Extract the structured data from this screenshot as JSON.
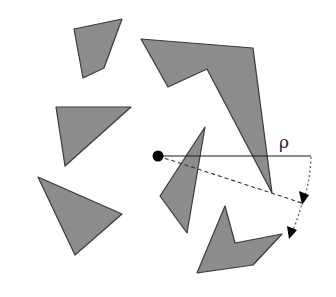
{
  "diagram": {
    "range_label": "ρ",
    "colors": {
      "obstacle_fill": "#8c8c8c",
      "obstacle_stroke": "#3a3a3a",
      "point": "#000000",
      "background": "#ffffff"
    },
    "obstacles": [
      {
        "name": "obstacle-quad-top-left"
      },
      {
        "name": "obstacle-triangle-left"
      },
      {
        "name": "obstacle-triangle-bottom-left"
      },
      {
        "name": "obstacle-large-concave-top-right"
      },
      {
        "name": "obstacle-triangle-center"
      },
      {
        "name": "obstacle-concave-bottom"
      }
    ]
  }
}
